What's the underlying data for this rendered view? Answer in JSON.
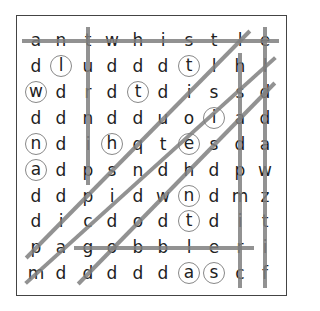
{
  "puzzle": {
    "title": "Word Search",
    "rows": [
      [
        "a",
        "n",
        "t",
        "w",
        "h",
        "i",
        "s",
        "t",
        "l",
        "e"
      ],
      [
        "d",
        "l",
        "u",
        "d",
        "d",
        "d",
        "t",
        "l",
        "h",
        "l"
      ],
      [
        "w",
        "d",
        "r",
        "d",
        "t",
        "d",
        "i",
        "s",
        "s",
        "d"
      ],
      [
        "d",
        "d",
        "n",
        "d",
        "d",
        "u",
        "o",
        "i",
        "a",
        "d"
      ],
      [
        "n",
        "d",
        "i",
        "h",
        "q",
        "t",
        "e",
        "s",
        "d",
        "a"
      ],
      [
        "a",
        "d",
        "p",
        "s",
        "n",
        "d",
        "h",
        "d",
        "p",
        "w"
      ],
      [
        "d",
        "d",
        "p",
        "i",
        "d",
        "w",
        "n",
        "d",
        "m",
        "z"
      ],
      [
        "d",
        "i",
        "c",
        "d",
        "o",
        "d",
        "t",
        "d",
        "i",
        "t"
      ],
      [
        "p",
        "a",
        "g",
        "o",
        "b",
        "b",
        "l",
        "e",
        "r",
        "i"
      ],
      [
        "m",
        "d",
        "d",
        "d",
        "d",
        "d",
        "a",
        "s",
        "c",
        "f"
      ]
    ],
    "circled_cells": [
      [
        1,
        1
      ],
      [
        2,
        0
      ],
      [
        1,
        6
      ],
      [
        2,
        4
      ],
      [
        3,
        7
      ],
      [
        4,
        0
      ],
      [
        4,
        3
      ],
      [
        4,
        6
      ],
      [
        5,
        0
      ],
      [
        6,
        6
      ],
      [
        7,
        6
      ],
      [
        9,
        6
      ],
      [
        9,
        7
      ]
    ],
    "found_lines": [
      {
        "word": "antwhistle",
        "from": [
          0,
          0
        ],
        "to": [
          0,
          9
        ]
      },
      {
        "word": "turnip",
        "from": [
          0,
          2
        ],
        "to": [
          5,
          2
        ]
      },
      {
        "word": "crimpdash",
        "from": [
          9,
          8
        ],
        "to": [
          1,
          8
        ]
      },
      {
        "word": "eldd awztif",
        "from": [
          0,
          9
        ],
        "to": [
          9,
          9
        ]
      },
      {
        "word": "diagonal-1",
        "from": [
          8,
          0
        ],
        "to": [
          0,
          8
        ]
      },
      {
        "word": "diagonal-2",
        "from": [
          9,
          0
        ],
        "to": [
          1,
          9
        ]
      },
      {
        "word": "diagonal-3",
        "from": [
          9,
          2
        ],
        "to": [
          2,
          9
        ]
      },
      {
        "word": "gobbler",
        "from": [
          8,
          2
        ],
        "to": [
          8,
          8
        ]
      }
    ],
    "line_color": "#7f7f7f",
    "circle_color": "#888888",
    "letter_color": "#222222"
  }
}
